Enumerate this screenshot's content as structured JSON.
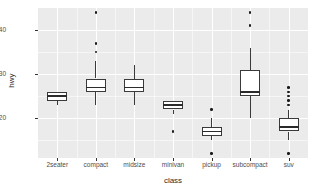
{
  "chart_data": {
    "type": "boxplot",
    "title": "",
    "xlabel": "class",
    "ylabel": "hwy",
    "categories": [
      "2seater",
      "compact",
      "midsize",
      "minivan",
      "pickup",
      "subcompact",
      "suv"
    ],
    "ylim": [
      11,
      45
    ],
    "y_ticks": [
      20,
      30,
      40
    ],
    "y_tick_labels": [
      "20",
      "30",
      "40"
    ],
    "y_minor_ticks": [
      15,
      25,
      35
    ],
    "grid": true,
    "legend": "none",
    "panel_background": "#ebebeb",
    "grid_color": "#ffffff",
    "box_fill": "#ffffff",
    "box_stroke": "#3a3a3a",
    "boxes": [
      {
        "category": "2seater",
        "lower_whisker": 23,
        "q1": 24,
        "median": 25,
        "q3": 26,
        "upper_whisker": 26,
        "outliers": []
      },
      {
        "category": "compact",
        "lower_whisker": 23,
        "q1": 26,
        "median": 27,
        "q3": 29,
        "upper_whisker": 33,
        "outliers": [
          35,
          37,
          44
        ]
      },
      {
        "category": "midsize",
        "lower_whisker": 23,
        "q1": 26,
        "median": 27,
        "q3": 29,
        "upper_whisker": 32,
        "outliers": []
      },
      {
        "category": "minivan",
        "lower_whisker": 21,
        "q1": 22,
        "median": 23,
        "q3": 24,
        "upper_whisker": 24,
        "outliers": [
          17
        ]
      },
      {
        "category": "pickup",
        "lower_whisker": 15,
        "q1": 16,
        "median": 17,
        "q3": 18,
        "upper_whisker": 20,
        "outliers": [
          22,
          12
        ]
      },
      {
        "category": "subcompact",
        "lower_whisker": 20,
        "q1": 25,
        "median": 26,
        "q3": 31,
        "upper_whisker": 36,
        "outliers": [
          41,
          44
        ]
      },
      {
        "category": "suv",
        "lower_whisker": 15,
        "q1": 17,
        "median": 18,
        "q3": 20,
        "upper_whisker": 22,
        "outliers": [
          23,
          24,
          25,
          26,
          27,
          12
        ]
      }
    ]
  }
}
